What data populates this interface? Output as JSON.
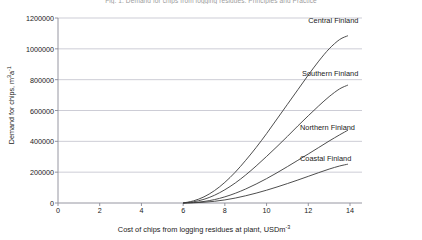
{
  "chart_data": {
    "type": "line",
    "title": "Fig. 1. Demand for chips from logging residues. Principles and Practice",
    "xlabel": "Cost of chips from logging residues at plant, USDm-3",
    "ylabel": "Demand for chips, m3a-1",
    "xlim": [
      0,
      14
    ],
    "ylim": [
      0,
      1200000
    ],
    "xticks": [
      0,
      2,
      4,
      6,
      8,
      10,
      12,
      14
    ],
    "xtick_labels": [
      "0",
      "2",
      "4",
      "6",
      "8",
      "10",
      "12",
      "14"
    ],
    "yticks": [
      0,
      200000,
      400000,
      600000,
      800000,
      1000000,
      1200000
    ],
    "ytick_labels": [
      "0",
      "200000",
      "400000",
      "600000",
      "800000",
      "1000000",
      "1200000"
    ],
    "grid": "horizontal",
    "legend_position": "inline-right",
    "line_color": "#3a3a3a",
    "grid_color": "#b8b8c4",
    "axis_color": "#8a8a96",
    "series": [
      {
        "name": "Central Finland",
        "label_x": 12.0,
        "label_y": 1185000,
        "x": [
          6.0,
          6.5,
          7.0,
          7.5,
          8.0,
          8.5,
          9.0,
          9.5,
          10.0,
          10.5,
          11.0,
          11.5,
          12.0,
          12.5,
          13.0,
          13.5,
          13.9
        ],
        "values": [
          0,
          14000,
          40000,
          80000,
          134000,
          200000,
          277000,
          360000,
          450000,
          545000,
          640000,
          735000,
          830000,
          920000,
          1000000,
          1060000,
          1085000
        ]
      },
      {
        "name": "Southern Finland",
        "label_x": 11.7,
        "label_y": 845000,
        "x": [
          6.0,
          6.5,
          7.0,
          7.5,
          8.0,
          8.5,
          9.0,
          9.5,
          10.0,
          10.5,
          11.0,
          11.5,
          12.0,
          12.5,
          13.0,
          13.5,
          13.9
        ],
        "values": [
          0,
          8000,
          24000,
          50000,
          86000,
          130000,
          182000,
          240000,
          302000,
          366000,
          432000,
          500000,
          566000,
          630000,
          690000,
          740000,
          765000
        ]
      },
      {
        "name": "Northern Finland",
        "label_x": 11.6,
        "label_y": 490000,
        "x": [
          6.0,
          6.5,
          7.0,
          7.5,
          8.0,
          8.5,
          9.0,
          9.5,
          10.0,
          10.5,
          11.0,
          11.5,
          12.0,
          12.5,
          13.0,
          13.5,
          13.9
        ],
        "values": [
          0,
          3000,
          10000,
          22000,
          40000,
          63000,
          91000,
          123000,
          158000,
          196000,
          236000,
          277000,
          318000,
          360000,
          402000,
          442000,
          472000
        ]
      },
      {
        "name": "Coastal Finland",
        "label_x": 11.6,
        "label_y": 290000,
        "x": [
          6.0,
          6.5,
          7.0,
          7.5,
          8.0,
          8.5,
          9.0,
          9.5,
          10.0,
          10.5,
          11.0,
          11.5,
          12.0,
          12.5,
          13.0,
          13.5,
          13.9
        ],
        "values": [
          0,
          1500,
          5000,
          11000,
          20000,
          32000,
          47000,
          64000,
          83000,
          104000,
          126000,
          149000,
          173000,
          197000,
          220000,
          240000,
          252000
        ]
      }
    ]
  },
  "axis_labels": {
    "ylabel_main": "Demand for chips, m",
    "ylabel_sup1": "3",
    "ylabel_mid": "a",
    "ylabel_sup2": "-1",
    "xlabel_main": "Cost of chips from logging residues at plant, USDm",
    "xlabel_sup": "-3"
  }
}
